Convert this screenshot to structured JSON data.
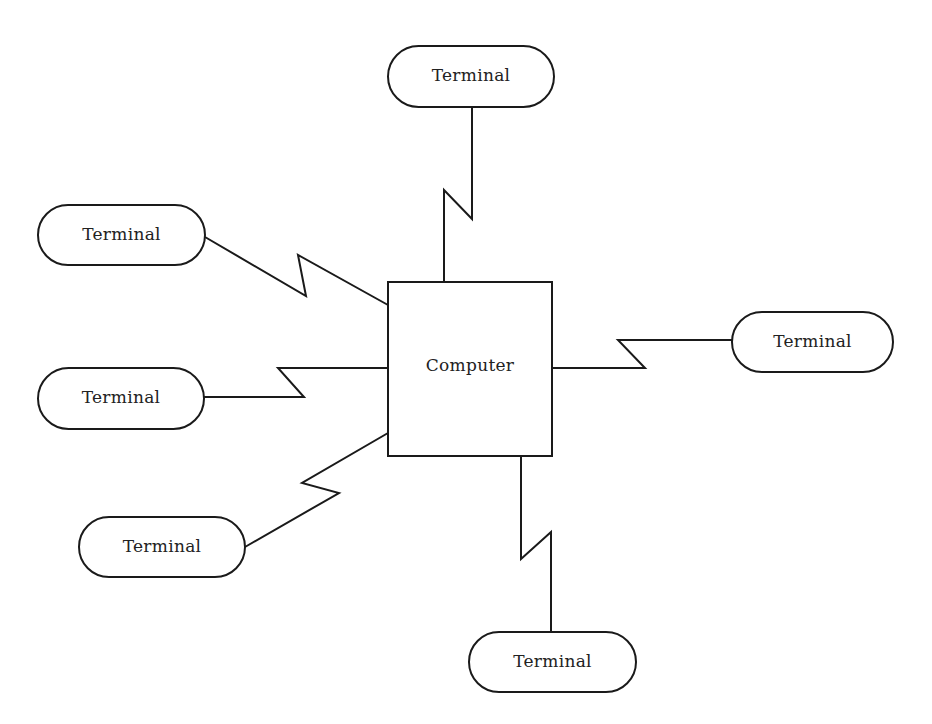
{
  "diagram": {
    "type": "star-network",
    "center": {
      "label": "Computer",
      "shape": "rectangle",
      "x": 388,
      "y": 282,
      "w": 164,
      "h": 174
    },
    "terminals": [
      {
        "id": "top",
        "label": "Terminal",
        "x": 388,
        "y": 46,
        "w": 166,
        "h": 61
      },
      {
        "id": "upper-left",
        "label": "Terminal",
        "x": 38,
        "y": 205,
        "w": 167,
        "h": 60
      },
      {
        "id": "middle-left",
        "label": "Terminal",
        "x": 38,
        "y": 368,
        "w": 166,
        "h": 61
      },
      {
        "id": "bottom-left",
        "label": "Terminal",
        "x": 79,
        "y": 517,
        "w": 166,
        "h": 60
      },
      {
        "id": "right",
        "label": "Terminal",
        "x": 732,
        "y": 312,
        "w": 161,
        "h": 60
      },
      {
        "id": "bottom",
        "label": "Terminal",
        "x": 469,
        "y": 632,
        "w": 167,
        "h": 60
      }
    ],
    "links": [
      {
        "id": "link-top",
        "points": "472,107 472,219 444,190 444,282"
      },
      {
        "id": "link-upper-left",
        "points": "205,237 306,296 298,255 388,305"
      },
      {
        "id": "link-middle-left",
        "points": "204,397 304,397 278,368 388,368"
      },
      {
        "id": "link-bottom-left",
        "points": "245,547 339,493 302,483 388,433"
      },
      {
        "id": "link-right",
        "points": "552,368 645,368 618,340 732,340"
      },
      {
        "id": "link-bottom",
        "points": "521,456 521,559 551,532 551,632"
      }
    ],
    "colors": {
      "stroke": "#1a1a1a",
      "fill": "#ffffff",
      "text": "#222222"
    }
  }
}
